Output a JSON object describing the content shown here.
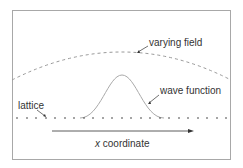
{
  "labels": {
    "varying_field": "varying field",
    "wave_function": "wave function",
    "lattice": "lattice",
    "x_var": "x",
    "x_rest": " coordinate"
  },
  "colors": {
    "frame": "#a8a8a8",
    "curve": "#999999",
    "dots": "#333333",
    "text": "#333333"
  }
}
